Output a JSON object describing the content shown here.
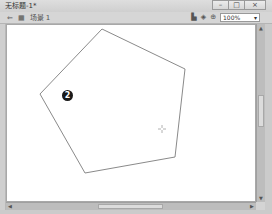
{
  "window": {
    "title": "无标题-1*",
    "controls": {
      "minimize": "–",
      "maximize": "□",
      "close": "×"
    }
  },
  "toolbar": {
    "back_icon": "⇐",
    "stage_icon": "▦",
    "scene_label": "场景 1",
    "right_icons": [
      "edit-symbol-icon",
      "edit-scene-icon",
      "center-stage-icon"
    ],
    "edit_symbols_glyph": "▙",
    "edit_scene_glyph": "◈",
    "center_glyph": "⊕",
    "zoom": {
      "value": "100%",
      "arrow": "▾"
    }
  },
  "canvas": {
    "background": "#ffffff",
    "stroke_color": "#8a8a8a",
    "pentagon_points": [
      [
        102,
        29
      ],
      [
        185,
        69
      ],
      [
        175,
        157
      ],
      [
        85,
        173
      ],
      [
        40,
        94
      ]
    ],
    "annotation": {
      "label": "2",
      "x": 67,
      "y": 95
    },
    "cursor": {
      "type": "crosshair",
      "x": 162,
      "y": 129
    }
  },
  "scrollbars": {
    "vertical": {
      "up": "▲",
      "down": "▼"
    },
    "horizontal": {
      "left": "◀",
      "right": "▶"
    }
  }
}
